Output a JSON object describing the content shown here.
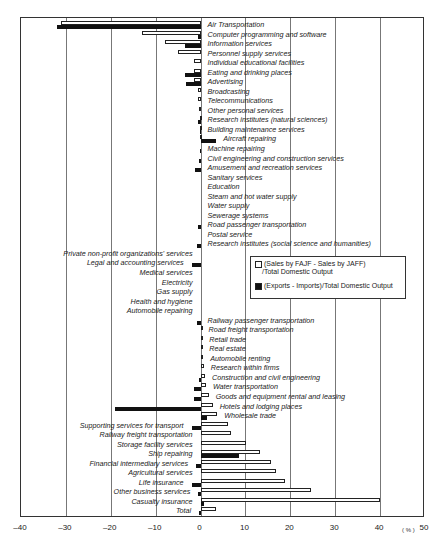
{
  "chart_data": {
    "type": "bar",
    "orientation": "horizontal",
    "title": "",
    "xlabel": "(%)",
    "xlim": [
      -40,
      50
    ],
    "xticks": [
      "-40",
      "-30",
      "-20",
      "-10",
      "0",
      "10",
      "20",
      "30",
      "40",
      "50"
    ],
    "grid": true,
    "legend_position": "inside-right-middle",
    "categories": [
      "Air Transportation",
      "Computer programming and software",
      "Information services",
      "Personnel supply services",
      "Individual educational facilities",
      "Eating and drinking places",
      "Advertising",
      "Broadcasting",
      "Telecommunications",
      "Other personal services",
      "Research institutes (natural sciences)",
      "Building maintenance services",
      "Aircraft repairing",
      "Machine repairing",
      "Civil engineering and construction services",
      "Amusement and recreation services",
      "Sanitary services",
      "Education",
      "Steam and hot water supply",
      "Water supply",
      "Sewerage systems",
      "Road passenger transportation",
      "Postal service",
      "Research institutes (social science and humanities)",
      "Private non-profit organizations' services",
      "Legal and accounting services",
      "Medical services",
      "Electricity",
      "Gas supply",
      "Health and hygiene",
      "Automobile repairing",
      "Railway passenger transportation",
      "Road freight transportation",
      "Retail trade",
      "Real estate",
      "Automobile renting",
      "Research within firms",
      "Construction and civil engineering",
      "Water transportation",
      "Goods and equipment rental and leasing",
      "Hotels and lodging places",
      "Wholesale trade",
      "Supporting services for transport",
      "Railway freight transportation",
      "Storage facility services",
      "Ship repairing",
      "Financial intermediary services",
      "Agricultural services",
      "Life insurance",
      "Other business services",
      "Casualty insurance",
      "Total"
    ],
    "series": [
      {
        "name": "(Sales by FAJF - Sales by JAFF)/Total Domestic Output",
        "style": "white",
        "values": [
          -31,
          -13,
          -8,
          -5,
          -1.5,
          -1.5,
          -1.5,
          -0.5,
          -0.5,
          -0.3,
          -0.2,
          -0.1,
          -0.1,
          0,
          0,
          0,
          0,
          0,
          0,
          0,
          0,
          0,
          0,
          0,
          0,
          0,
          0,
          0,
          0,
          0,
          0,
          0,
          0.2,
          0.4,
          0.4,
          0.6,
          0.7,
          1,
          1.2,
          1.8,
          2.7,
          3.7,
          6.2,
          6.7,
          10.2,
          13.3,
          15.8,
          16.7,
          18.8,
          24.5,
          40,
          3.5
        ]
      },
      {
        "name": "(Exports - Imports)/Total Domestic Output",
        "style": "black",
        "values": [
          -32,
          -0.5,
          -3.5,
          0,
          0,
          -3.5,
          -3.3,
          0,
          0,
          0,
          -0.5,
          -0.2,
          3.5,
          -0.2,
          -0.3,
          -1.2,
          0,
          0,
          0,
          0,
          0,
          -0.5,
          0,
          -0.8,
          0,
          -2,
          0,
          0,
          0,
          0,
          0,
          -0.8,
          0,
          0,
          0,
          0,
          0,
          -0.3,
          -1.5,
          -1.5,
          -19,
          1.5,
          -2,
          0,
          0,
          8.5,
          -1,
          0,
          -2,
          -0.5,
          0.7,
          -0.3
        ]
      }
    ]
  },
  "legend": {
    "white_line1": "(Sales by FAJF - Sales by JAFF)",
    "white_line2": "/Total Domestic Output",
    "black_line": "(Exports - Imports)/Total Domestic Output"
  },
  "unit": "( % )"
}
